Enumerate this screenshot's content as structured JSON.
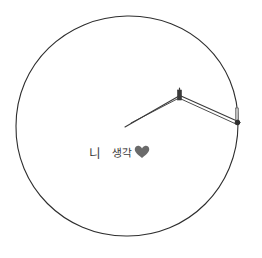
{
  "illustration": {
    "description": "Hand-drawn circle with a drawing compass",
    "circle": {
      "cx": 127,
      "cy": 126,
      "rx": 111,
      "ry": 110,
      "stroke": "#2e2e2e"
    },
    "compass": {
      "needle_point": [
        125,
        127
      ],
      "hinge": [
        180,
        95
      ],
      "pencil_point": [
        238,
        122
      ],
      "stroke": "#3a3a3a"
    }
  },
  "caption": {
    "word1": "니",
    "word2": "생각",
    "heart_icon": "heart-icon",
    "heart_color": "#6a6a6a"
  }
}
